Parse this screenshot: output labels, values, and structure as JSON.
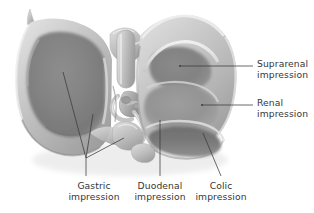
{
  "figure": {
    "background_color": "#ffffff",
    "line_color": "#3a3a3a",
    "text_color": "#363636"
  },
  "labels": {
    "suprarenal": {
      "line1": "Suprarenal",
      "line2": "impression",
      "position": "right",
      "text_x": 257,
      "text_y": 58,
      "leader": {
        "x1": 180,
        "y1": 66,
        "x2": 253,
        "y2": 66
      }
    },
    "renal": {
      "line1": "Renal",
      "line2": "impression",
      "position": "right",
      "text_x": 257,
      "text_y": 97,
      "leader": {
        "x1": 202,
        "y1": 105,
        "x2": 253,
        "y2": 105
      }
    },
    "gastric": {
      "line1": "Gastric",
      "line2": "impression",
      "position": "bottom",
      "text_x": 94,
      "text_y": 180,
      "leader": {
        "x1": 86,
        "y1": 158,
        "x2": 86,
        "y2": 176
      }
    },
    "duodenal": {
      "line1": "Duodenal",
      "line2": "impression",
      "position": "bottom",
      "text_x": 160,
      "text_y": 180,
      "leader": {
        "x1": 160,
        "y1": 120,
        "x2": 160,
        "y2": 176
      }
    },
    "colic": {
      "line1": "Colic",
      "line2": "impression",
      "position": "bottom",
      "text_x": 221,
      "text_y": 180,
      "leader": {
        "x1": 203,
        "y1": 133,
        "x2": 221,
        "y2": 176
      }
    }
  },
  "anatomy": {
    "left_lobe": "left lobe with gastric impression",
    "right_lobe": "right lobe with suprarenal, renal and colic impressions",
    "porta_hepatis": "porta hepatis vessels and ducts",
    "caudate_lobe": "caudate lobe",
    "quadrate_lobe": "quadrate lobe",
    "gallbladder": "gallbladder fossa"
  }
}
